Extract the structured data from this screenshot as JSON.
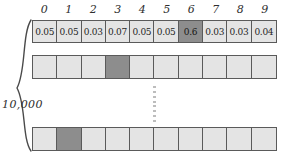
{
  "diagram": {
    "row_count_label": "10,000",
    "column_headers": [
      "0",
      "1",
      "2",
      "3",
      "4",
      "5",
      "6",
      "7",
      "8",
      "9"
    ],
    "ellipsis_symbol": "vertical-ellipsis",
    "colors": {
      "cell_fill": "#e4e4e4",
      "highlight_fill": "#8d8d8d",
      "border": "#5a5a5a",
      "text": "#1f1f1f",
      "background": "#ffffff"
    },
    "rows": [
      {
        "name": "first-row",
        "has_values": true,
        "highlight_index": 6,
        "cells": [
          "0.05",
          "0.05",
          "0.03",
          "0.07",
          "0.05",
          "0.05",
          "0.6",
          "0.03",
          "0.03",
          "0.04"
        ]
      },
      {
        "name": "second-row",
        "has_values": false,
        "highlight_index": 3,
        "cells": [
          "",
          "",
          "",
          "",
          "",
          "",
          "",
          "",
          "",
          ""
        ]
      },
      {
        "name": "last-row",
        "has_values": false,
        "highlight_index": 1,
        "cells": [
          "",
          "",
          "",
          "",
          "",
          "",
          "",
          "",
          "",
          ""
        ]
      }
    ]
  }
}
